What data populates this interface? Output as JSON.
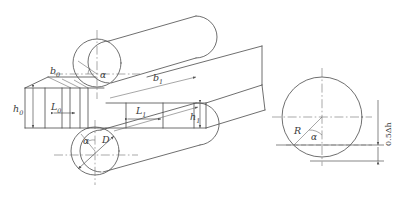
{
  "figure": {
    "kind": "engineering-drawing",
    "line_color": "#4a4a4a",
    "centerline_color": "#6e6e6e",
    "background": "#ffffff"
  },
  "labels": {
    "h0": {
      "base": "h",
      "sub": "0",
      "meaning": "entry-thickness"
    },
    "h1": {
      "base": "h",
      "sub": "1",
      "meaning": "exit-thickness"
    },
    "b0": {
      "base": "b",
      "sub": "0",
      "meaning": "entry-width"
    },
    "b1": {
      "base": "b",
      "sub": "1",
      "meaning": "exit-width"
    },
    "L0": {
      "base": "L",
      "sub": "0",
      "meaning": "entry-contact-length"
    },
    "L1": {
      "base": "L",
      "sub": "1",
      "meaning": "exit-contact-length"
    },
    "D": {
      "base": "D",
      "sub": "",
      "meaning": "roll-diameter"
    },
    "R": {
      "base": "R",
      "sub": "",
      "meaning": "roll-radius"
    },
    "alpha_top": {
      "base": "α",
      "meaning": "bite-angle-top-roll"
    },
    "alpha_bottom": {
      "base": "α",
      "meaning": "bite-angle-bottom-roll"
    },
    "alpha_detail": {
      "base": "α",
      "meaning": "bite-angle-detail"
    },
    "half_delta_h": {
      "text": "0.5Δh",
      "meaning": "half-thickness-reduction"
    }
  },
  "views": {
    "main": {
      "name": "isometric-roll-gap-view",
      "parts": [
        "top-roll-cylinder",
        "bottom-roll-cylinder",
        "workpiece-slab",
        "deformation-zone"
      ]
    },
    "detail": {
      "name": "roll-circle-detail-view",
      "parts": [
        "roll-circle",
        "radius-line",
        "bite-angle",
        "chord-line",
        "reduction-dimension"
      ]
    }
  }
}
